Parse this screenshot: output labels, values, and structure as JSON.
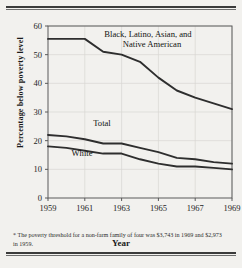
{
  "figure": {
    "footnote": "* The poverty threshold for a non-farm family of four was $3,743 in 1969 and $2,973 in 1959.",
    "background_color": "#f2f1ee",
    "rule_color": "#3b3b3b"
  },
  "chart_data": {
    "type": "line",
    "title": "",
    "xlabel": "Year",
    "ylabel": "Percentage below poverty level",
    "xlim": [
      1959,
      1969
    ],
    "ylim": [
      0,
      60
    ],
    "grid": true,
    "legend_position": "inline-annotations",
    "x": [
      1959,
      1960,
      1961,
      1962,
      1963,
      1964,
      1965,
      1966,
      1967,
      1968,
      1969
    ],
    "xticks": [
      "1959",
      "1961",
      "1963",
      "1965",
      "1967",
      "1969"
    ],
    "xtick_values": [
      1959,
      1961,
      1963,
      1965,
      1967,
      1969
    ],
    "yticks": [
      "0",
      "10",
      "20",
      "30",
      "40",
      "50",
      "60"
    ],
    "ytick_values": [
      0,
      10,
      20,
      30,
      40,
      50,
      60
    ],
    "line_color": "#2e2e2e",
    "series": [
      {
        "name": "Black, Latino, Asian, and Native American",
        "label": "Black, Latino, Asian, and",
        "label_line2": "Native American",
        "values": [
          55.5,
          55.5,
          55.5,
          51.0,
          50.0,
          47.5,
          42.0,
          37.5,
          35.0,
          33.0,
          31.0
        ]
      },
      {
        "name": "Total",
        "label": "Total",
        "values": [
          22.0,
          21.5,
          20.5,
          19.0,
          19.0,
          17.5,
          16.0,
          14.0,
          13.5,
          12.5,
          12.0
        ]
      },
      {
        "name": "White",
        "label": "White",
        "values": [
          18.0,
          17.5,
          16.5,
          15.5,
          15.5,
          13.5,
          12.0,
          11.0,
          11.0,
          10.5,
          10.0
        ]
      }
    ]
  }
}
